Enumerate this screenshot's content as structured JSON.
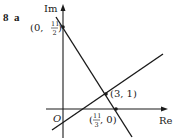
{
  "problem": {
    "number": "8",
    "part": "a"
  },
  "axes": {
    "vertical_label": "Im",
    "horizontal_label": "Re",
    "origin_label": "O"
  },
  "points": [
    {
      "name": "y-intercept",
      "label": "(0, 11/2)",
      "x_text": "(0, ",
      "num": "11",
      "den": "2",
      "close": ")"
    },
    {
      "name": "intersection",
      "label": "(3, 1)"
    },
    {
      "name": "x-intercept",
      "label": "(11/3, 0)",
      "open": "(",
      "num": "11",
      "den": "3",
      "rest": ", 0)"
    }
  ],
  "lines": [
    {
      "name": "steep-line",
      "description": "line through (0, 11/2) and (11/3, 0)"
    },
    {
      "name": "shallow-line",
      "description": "line through (3, 1) with positive slope"
    }
  ],
  "colors": {
    "ink": "#1a1a1a",
    "background": "#ffffff"
  }
}
